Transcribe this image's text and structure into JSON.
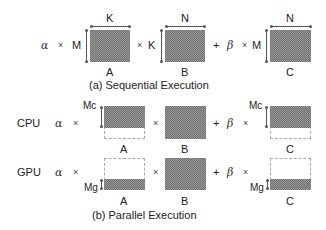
{
  "sequential": {
    "alpha": "α",
    "times": "×",
    "plus": "+",
    "beta": "β",
    "dims": {
      "A_rows": "M",
      "A_cols": "K",
      "B_rows": "K",
      "B_cols": "N",
      "C_rows": "M",
      "C_cols": "N"
    },
    "matrix_labels": {
      "A": "A",
      "B": "B",
      "C": "C"
    },
    "caption": "(a) Sequential Execution"
  },
  "parallel": {
    "cpu": {
      "label": "CPU",
      "alpha": "α",
      "times": "×",
      "plus": "+",
      "beta": "β",
      "partition_label_A": "Mc",
      "partition_label_C": "Mc",
      "matrix_labels": {
        "A": "A",
        "B": "B",
        "C": "C"
      }
    },
    "gpu": {
      "label": "GPU",
      "alpha": "α",
      "times": "×",
      "plus": "+",
      "beta": "β",
      "partition_label_A": "Mg",
      "partition_label_C": "Mg",
      "matrix_labels": {
        "A": "A",
        "B": "B",
        "C": "C"
      }
    },
    "caption": "(b) Parallel Execution"
  },
  "colors": {
    "shade_dark": "#6f6f6f",
    "shade_light": "#9a9a9a",
    "dashed_border": "#aaaaaa"
  }
}
